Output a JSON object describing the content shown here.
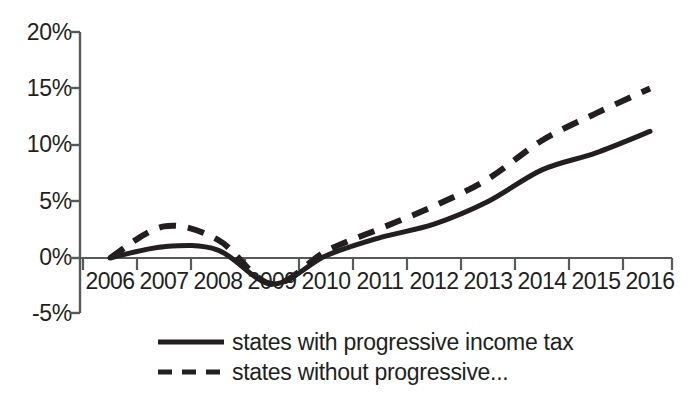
{
  "chart_data": {
    "type": "line",
    "title": "",
    "subtitle": "",
    "xlabel": "",
    "ylabel": "",
    "x": [
      2006,
      2007,
      2008,
      2009,
      2010,
      2011,
      2012,
      2013,
      2014,
      2015,
      2016
    ],
    "categories": [
      "2006",
      "2007",
      "2008",
      "2009",
      "2010",
      "2011",
      "2012",
      "2013",
      "2014",
      "2015",
      "2016"
    ],
    "ylim": [
      -5,
      20
    ],
    "yticks": [
      -5,
      0,
      5,
      10,
      15,
      20
    ],
    "ytick_labels": [
      "-5%",
      "0%",
      "5%",
      "10%",
      "15%",
      "20%"
    ],
    "grid": false,
    "legend_position": "bottom",
    "value_format": "percent",
    "series": [
      {
        "name": "states with progressive income tax",
        "style": "solid",
        "color": "#231f20",
        "values": [
          0.0,
          1.0,
          0.7,
          -2.3,
          0.2,
          1.8,
          3.0,
          5.0,
          7.8,
          9.3,
          11.2
        ]
      },
      {
        "name": "states without progressive...",
        "style": "dashed",
        "color": "#231f20",
        "values": [
          0.0,
          2.8,
          1.6,
          -2.3,
          0.6,
          2.6,
          4.6,
          7.0,
          10.4,
          12.8,
          15.0
        ]
      }
    ]
  },
  "axis": {
    "y_tick_labels": [
      "20%",
      "15%",
      "10%",
      "5%",
      "0%",
      "-5%"
    ],
    "x_tick_labels": [
      "2006",
      "2007",
      "2008",
      "2009",
      "2010",
      "2011",
      "2012",
      "2013",
      "2014",
      "2015",
      "2016"
    ]
  },
  "legend": {
    "items": [
      {
        "label": "states with progressive income tax",
        "style": "solid"
      },
      {
        "label": "states without progressive...",
        "style": "dashed"
      }
    ]
  },
  "colors": {
    "line": "#231f20",
    "axis": "#58595b",
    "background": "#ffffff"
  }
}
